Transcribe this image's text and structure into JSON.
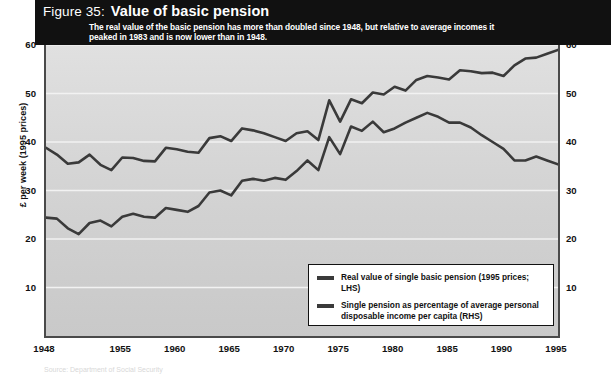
{
  "figure": {
    "label": "Figure 35:",
    "title": "Value of basic pension",
    "subtitle": "The real value of the basic pension has more than doubled since 1948, but relative to average incomes it peaked in 1983 and is now lower than in 1948."
  },
  "axes": {
    "y_left_title": "£ per week (1995 prices)",
    "y_right_title": "Percentage of average personal disposable income per capita",
    "y_ticks": [
      10,
      20,
      30,
      40,
      50,
      60
    ],
    "x_ticks": [
      1948,
      1955,
      1960,
      1965,
      1970,
      1975,
      1980,
      1985,
      1990,
      1995
    ]
  },
  "legend": {
    "items": [
      {
        "label": "Real value of single basic pension (1995 prices; LHS)",
        "color": "#3a3a3a"
      },
      {
        "label": "Single pension as percentage of average personal disposable income per capita (RHS)",
        "color": "#3a3a3a"
      }
    ]
  },
  "source": "Source: Department of Social Security",
  "colors": {
    "banner": "#111111",
    "plot_background": "#d6d6d6",
    "line": "#3a3a3a",
    "gridline": "#f2f2f2",
    "axis": "#4a4a4a"
  },
  "chart_data": {
    "type": "line",
    "title": "Value of basic pension",
    "subtitle": "The real value of the basic pension has more than doubled since 1948, but relative to average incomes it peaked in 1983 and is now lower than in 1948.",
    "xlabel": "",
    "ylabel": "£ per week (1995 prices)",
    "y2label": "Percentage of average personal disposable income per capita",
    "xlim": [
      1948,
      1995
    ],
    "ylim": [
      0,
      60
    ],
    "y2lim": [
      0,
      60
    ],
    "grid": true,
    "legend_position": "inside-bottom-right",
    "x": [
      1948,
      1949,
      1950,
      1951,
      1952,
      1953,
      1954,
      1955,
      1956,
      1957,
      1958,
      1959,
      1960,
      1961,
      1962,
      1963,
      1964,
      1965,
      1966,
      1967,
      1968,
      1969,
      1970,
      1971,
      1972,
      1973,
      1974,
      1975,
      1976,
      1977,
      1978,
      1979,
      1980,
      1981,
      1982,
      1983,
      1984,
      1985,
      1986,
      1987,
      1988,
      1989,
      1990,
      1991,
      1992,
      1993,
      1994,
      1995
    ],
    "series": [
      {
        "name": "Real value of single basic pension (1995 prices; LHS)",
        "axis": "left",
        "color": "#3a3a3a",
        "values": [
          38.8,
          37.4,
          35.5,
          35.8,
          37.4,
          35.3,
          34.2,
          36.8,
          36.7,
          36.1,
          36.0,
          38.8,
          38.5,
          38.0,
          37.8,
          40.8,
          41.2,
          40.2,
          42.8,
          42.4,
          41.8,
          41.0,
          40.2,
          41.8,
          42.2,
          40.4,
          48.6,
          44.2,
          48.8,
          48.0,
          50.2,
          49.8,
          51.4,
          50.6,
          52.8,
          53.6,
          53.3,
          52.9,
          54.8,
          54.6,
          54.2,
          54.3,
          53.6,
          55.8,
          57.2,
          57.4,
          58.2,
          59.0
        ]
      },
      {
        "name": "Single pension as percentage of average personal disposable income per capita (RHS)",
        "axis": "right",
        "color": "#3a3a3a",
        "values": [
          24.4,
          24.2,
          22.2,
          21.0,
          23.3,
          23.8,
          22.6,
          24.6,
          25.2,
          24.6,
          24.4,
          26.4,
          26.0,
          25.6,
          26.8,
          29.6,
          30.0,
          29.0,
          32.0,
          32.4,
          32.0,
          32.6,
          32.2,
          34.0,
          36.2,
          34.2,
          41.0,
          37.5,
          43.2,
          42.3,
          44.2,
          42.0,
          42.8,
          44.0,
          45.0,
          46.0,
          45.2,
          44.0,
          44.0,
          43.0,
          41.4,
          40.0,
          38.6,
          36.2,
          36.2,
          37.0,
          36.2,
          35.4
        ]
      }
    ]
  }
}
